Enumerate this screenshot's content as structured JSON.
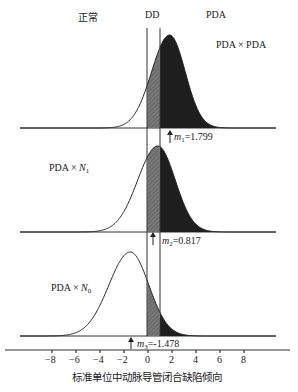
{
  "chart_data": {
    "type": "area",
    "title": "",
    "xlabel": "标准单位中动脉导管闭合缺陷倾向",
    "ylabel": "",
    "xlim": [
      -10,
      11
    ],
    "x_ticks": [
      -8,
      -6,
      -4,
      -2,
      0,
      2,
      4,
      6,
      8
    ],
    "grid": false,
    "region_labels": [
      "正常",
      "DD",
      "PDA"
    ],
    "thresholds": [
      {
        "name": "DD lower",
        "x": 0
      },
      {
        "name": "DD upper / PDA",
        "x": 1.0
      }
    ],
    "series": [
      {
        "name": "PDA × PDA",
        "mean_label": "m1=1.799",
        "mean": 1.799,
        "sd": 1.3
      },
      {
        "name": "PDA × N1",
        "mean_label": "m2=0.817",
        "mean": 0.817,
        "sd": 1.45
      },
      {
        "name": "PDA × N0",
        "mean_label": "m3=-1.478",
        "mean": -1.478,
        "sd": 1.55
      }
    ]
  },
  "labels": {
    "normal": "正常",
    "dd": "DD",
    "pda": "PDA",
    "panel1": "PDA × PDA",
    "panel2_prefix": "PDA × ",
    "panel2_var": "N",
    "panel2_sub": "1",
    "panel3_prefix": "PDA × ",
    "panel3_var": "N",
    "panel3_sub": "0",
    "m1_var": "m",
    "m1_sub": "1",
    "m1_val": "=1.799",
    "m2_var": "m",
    "m2_sub": "2",
    "m2_val": "=0.817",
    "m3_var": "m",
    "m3_sub": "3",
    "m3_val": "=-1.478",
    "xlabel": "标准单位中动脉导管闭合缺陷倾向",
    "ticks": [
      "−8",
      "−6",
      "−4",
      "−2",
      "0",
      "2",
      "4",
      "6",
      "8"
    ]
  }
}
